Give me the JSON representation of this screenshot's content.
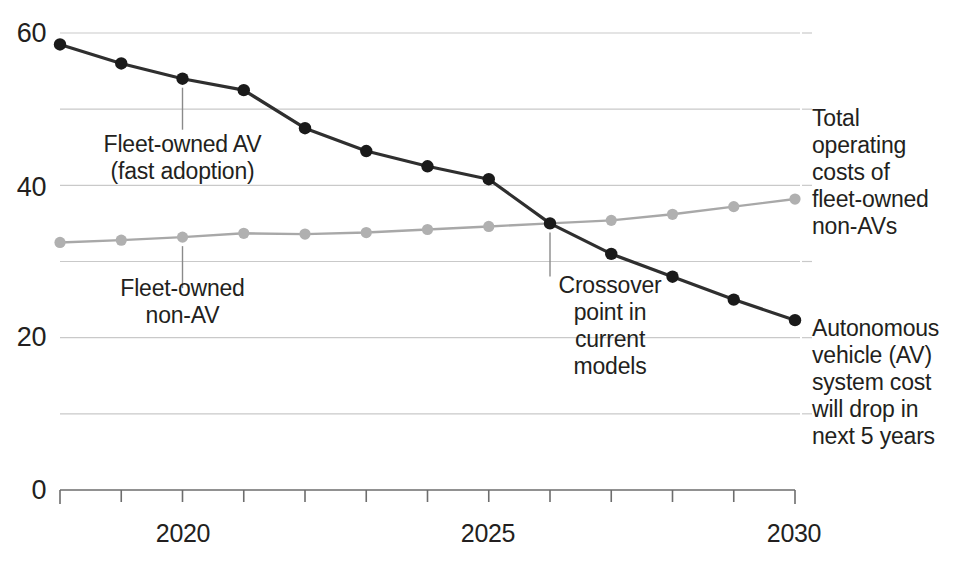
{
  "chart_data": {
    "type": "line",
    "title": "",
    "subtitle": "",
    "xlabel": "",
    "ylabel": "",
    "xlim": [
      2018,
      2030
    ],
    "ylim": [
      0,
      62
    ],
    "yticks": [
      0,
      20,
      40,
      60
    ],
    "ytick_labels": [
      "0",
      "20",
      "40",
      "60"
    ],
    "gridlines": [
      10,
      20,
      30,
      40,
      50,
      60
    ],
    "grid": true,
    "legend_position": "right-inline-labels",
    "x": [
      2018,
      2019,
      2020,
      2021,
      2022,
      2023,
      2024,
      2025,
      2026,
      2027,
      2028,
      2029,
      2030
    ],
    "xticks": [
      2018,
      2019,
      2020,
      2021,
      2022,
      2023,
      2024,
      2025,
      2026,
      2027,
      2028,
      2029,
      2030
    ],
    "xtick_labels": [
      "",
      "",
      "2020",
      "",
      "",
      "",
      "",
      "2025",
      "",
      "",
      "",
      "",
      "2030"
    ],
    "series": [
      {
        "name": "Fleet-owned AV (fast adoption)",
        "color": "#2f2f2f",
        "marker_color": "#1a1a1a",
        "values": [
          58.5,
          56.0,
          54.0,
          52.5,
          47.5,
          44.5,
          42.5,
          40.8,
          35.0,
          31.0,
          28.0,
          25.0,
          22.3
        ]
      },
      {
        "name": "Fleet-owned non-AV",
        "color": "#a8a8a8",
        "marker_color": "#b0b0b0",
        "values": [
          32.5,
          32.8,
          33.2,
          33.7,
          33.6,
          33.8,
          34.2,
          34.6,
          35.0,
          35.4,
          36.2,
          37.2,
          38.2
        ]
      }
    ],
    "annotations": [
      {
        "id": "fleet-av",
        "text": "Fleet-owned AV\n(fast adoption)",
        "anchor_x": 2020,
        "anchor_y": 54.0
      },
      {
        "id": "fleet-non-av",
        "text": "Fleet-owned\nnon-AV",
        "anchor_x": 2020,
        "anchor_y": 33.2
      },
      {
        "id": "crossover",
        "text": "Crossover\npoint in\ncurrent\nmodels",
        "anchor_x": 2026,
        "anchor_y": 35.0
      }
    ],
    "side_labels": [
      {
        "id": "non-av-total",
        "text": "Total\noperating\ncosts of\nfleet-owned\nnon-AVs",
        "anchor_x": 2030,
        "anchor_y": 38.2
      },
      {
        "id": "av-system-cost",
        "text": "Autonomous\nvehicle (AV)\nsystem cost\nwill drop in\nnext 5 years",
        "anchor_x": 2030,
        "anchor_y": 22.3
      }
    ]
  },
  "axis": {
    "y_labels": [
      "60",
      "40",
      "20",
      "0"
    ],
    "x_labels": [
      "2020",
      "2025",
      "2030"
    ]
  },
  "annotation_text": {
    "fleet_av": "Fleet-owned AV\n(fast adoption)",
    "fleet_non_av": "Fleet-owned\nnon-AV",
    "crossover": "Crossover\npoint in\ncurrent\nmodels",
    "non_av_total": "Total\noperating\ncosts of\nfleet-owned\nnon-AVs",
    "av_system_cost": "Autonomous\nvehicle (AV)\nsystem cost\nwill drop in\nnext 5 years"
  },
  "colors": {
    "av_line": "#2f2f2f",
    "non_av_line": "#a8a8a8",
    "grid": "#c9c9c9",
    "axis": "#6d6d6d",
    "text": "#231f20"
  }
}
